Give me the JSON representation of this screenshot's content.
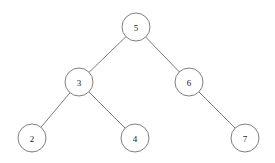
{
  "diagram": {
    "type": "binary-tree",
    "canvas": {
      "width": 275,
      "height": 163
    },
    "style": {
      "background_color": "#ffffff",
      "node_fill": "#ffffff",
      "node_stroke": "#707070",
      "edge_stroke": "#6b6b6b",
      "label_color": "#1a1a1a",
      "node_radius": 14
    },
    "nodes": [
      {
        "id": "n5",
        "label": "5",
        "cx": 136,
        "cy": 27,
        "r": 14,
        "role": "root",
        "depth": 0
      },
      {
        "id": "n3",
        "label": "3",
        "cx": 79,
        "cy": 82,
        "r": 14,
        "role": "left-child",
        "depth": 1
      },
      {
        "id": "n6",
        "label": "6",
        "cx": 189,
        "cy": 82,
        "r": 14,
        "role": "right-child",
        "depth": 1
      },
      {
        "id": "n2",
        "label": "2",
        "cx": 32,
        "cy": 138,
        "r": 14,
        "role": "leaf",
        "depth": 2
      },
      {
        "id": "n4",
        "label": "4",
        "cx": 135,
        "cy": 138,
        "r": 14,
        "role": "leaf",
        "depth": 2
      },
      {
        "id": "n7",
        "label": "7",
        "cx": 245,
        "cy": 138,
        "r": 14,
        "role": "leaf",
        "depth": 2
      }
    ],
    "edges": [
      {
        "id": "e5-3",
        "from": "n5",
        "to": "n3",
        "side": "left"
      },
      {
        "id": "e5-6",
        "from": "n5",
        "to": "n6",
        "side": "right"
      },
      {
        "id": "e3-2",
        "from": "n3",
        "to": "n2",
        "side": "left"
      },
      {
        "id": "e3-4",
        "from": "n3",
        "to": "n4",
        "side": "right"
      },
      {
        "id": "e6-7",
        "from": "n6",
        "to": "n7",
        "side": "right"
      }
    ]
  }
}
